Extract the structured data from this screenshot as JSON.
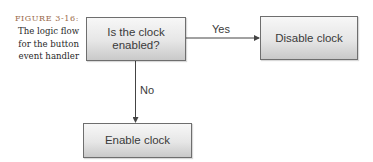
{
  "caption": {
    "figure_label": "FIGURE 3-16:",
    "lines": [
      "The logic flow",
      "for the button",
      "event handler"
    ]
  },
  "flowchart": {
    "decision": {
      "text_line1": "Is the clock",
      "text_line2": "enabled?"
    },
    "yes_branch": {
      "label": "Yes",
      "target": "Disable clock"
    },
    "no_branch": {
      "label": "No",
      "target": "Enable clock"
    }
  },
  "colors": {
    "box_border": "#6e6e6e",
    "line": "#444444",
    "caption_accent": "#9a6a4a"
  }
}
